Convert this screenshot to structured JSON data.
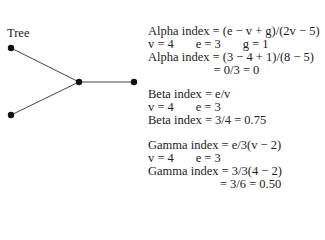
{
  "diagram": {
    "title": "Tree",
    "nodes": [
      {
        "id": "a",
        "x": 11,
        "y": 48
      },
      {
        "id": "b",
        "x": 11,
        "y": 115
      },
      {
        "id": "c",
        "x": 79,
        "y": 82
      },
      {
        "id": "d",
        "x": 134,
        "y": 82
      }
    ],
    "edges": [
      [
        "a",
        "c"
      ],
      [
        "b",
        "c"
      ],
      [
        "c",
        "d"
      ]
    ]
  },
  "alpha": {
    "formula": "Alpha index = (e − v + g)/(2v − 5)",
    "values": "v = 4       e = 3       g = 1",
    "calc": "Alpha index = (3 − 4 + 1)/(8 − 5)",
    "result": "                     = 0/3 = 0"
  },
  "beta": {
    "formula": "Beta index = e/v",
    "values": "v = 4       e = 3",
    "calc": "Beta index = 3/4 = 0.75"
  },
  "gamma": {
    "formula": "Gamma index = e/3(v − 2)",
    "values": "v = 4       e = 3",
    "calc": "Gamma index = 3/3(4 − 2)",
    "result": "                       = 3/6 = 0.50"
  }
}
